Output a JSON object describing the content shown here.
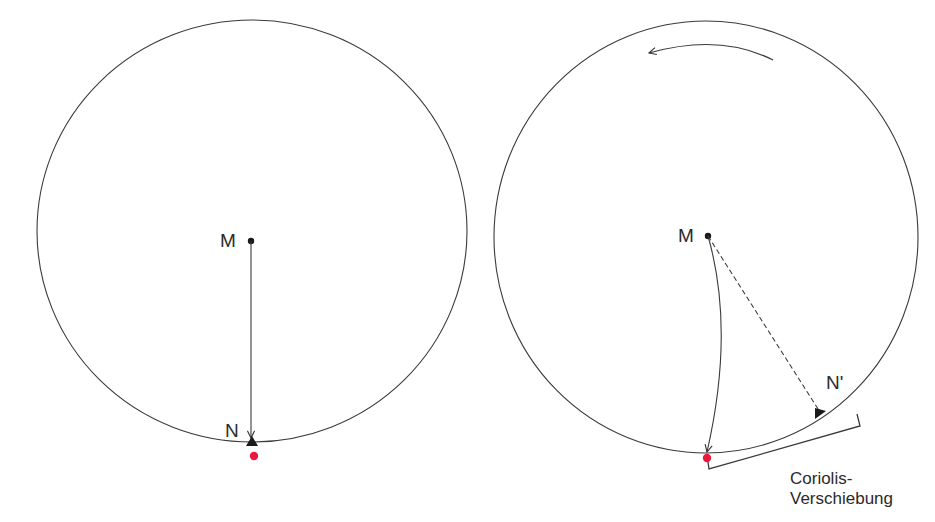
{
  "diagram": {
    "left_panel": {
      "description": "stationary disk",
      "center_label": "M",
      "target_label": "N"
    },
    "right_panel": {
      "description": "rotating disk (counter-clockwise rotation arrow)",
      "center_label": "M",
      "target_label": "N'",
      "caption_line1": "Coriolis-",
      "caption_line2": "Verschiebung"
    },
    "colors": {
      "stroke": "#3a3a3a",
      "marker": "#e8193c",
      "background": "#ffffff"
    }
  }
}
